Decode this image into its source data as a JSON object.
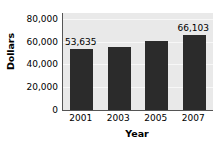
{
  "chart_data": {
    "type": "bar",
    "title": "",
    "xlabel": "Year",
    "ylabel": "Dollars",
    "categories": [
      "2001",
      "2003",
      "2005",
      "2007"
    ],
    "values": [
      53635,
      55000,
      60500,
      66103
    ],
    "data_labels": [
      "53,635",
      "",
      "",
      "66,103"
    ],
    "ylim": [
      0,
      85000
    ],
    "yticks": [
      0,
      20000,
      40000,
      60000,
      80000
    ],
    "ytick_labels": [
      "0",
      "20,000",
      "40,000",
      "60,000",
      "80,000"
    ],
    "grid": true,
    "legend": false,
    "colors": {
      "bar": "#2b2b2b",
      "plot_background": "#e9e9e9",
      "axis": "#555555",
      "gridline": "#f7f7f7",
      "text": "#000000",
      "page_background": "#ffffff"
    }
  }
}
